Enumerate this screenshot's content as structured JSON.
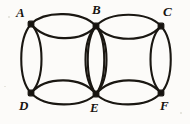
{
  "figure": {
    "ink_color": "#1a1712",
    "background_color": "#fcfbf9",
    "width": 190,
    "height": 124,
    "vertices": [
      {
        "id": "A",
        "label": "A",
        "x": 31,
        "y": 24,
        "label_x": 16,
        "label_y": 6
      },
      {
        "id": "B",
        "label": "B",
        "x": 96,
        "y": 26,
        "label_x": 92,
        "label_y": 3
      },
      {
        "id": "C",
        "label": "C",
        "x": 161,
        "y": 26,
        "label_x": 163,
        "label_y": 5
      },
      {
        "id": "D",
        "label": "D",
        "x": 31,
        "y": 93,
        "label_x": 19,
        "label_y": 99
      },
      {
        "id": "E",
        "label": "E",
        "x": 96,
        "y": 94,
        "label_x": 90,
        "label_y": 101
      },
      {
        "id": "F",
        "label": "F",
        "x": 161,
        "y": 93,
        "label_x": 160,
        "label_y": 99
      }
    ],
    "circles": [
      {
        "id": "left-circle",
        "cx": 64,
        "cy": 59,
        "rx": 44,
        "ry": 35
      },
      {
        "id": "right-circle",
        "cx": 129,
        "cy": 59,
        "rx": 44,
        "ry": 35
      }
    ],
    "arc_pairs": [
      {
        "id": "arc-A-B",
        "from": "A",
        "to": "B"
      },
      {
        "id": "arc-B-C",
        "from": "B",
        "to": "C"
      },
      {
        "id": "arc-D-E",
        "from": "D",
        "to": "E"
      },
      {
        "id": "arc-E-F",
        "from": "E",
        "to": "F"
      },
      {
        "id": "arc-A-D",
        "from": "A",
        "to": "D"
      },
      {
        "id": "arc-B-E",
        "from": "B",
        "to": "E"
      },
      {
        "id": "arc-C-F",
        "from": "C",
        "to": "F"
      }
    ]
  }
}
